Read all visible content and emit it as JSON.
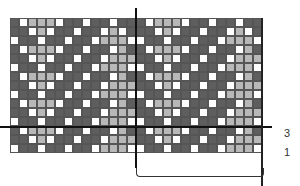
{
  "chart_title": "",
  "labels": {
    "row_3": "3",
    "row_1": "1"
  },
  "colors": {
    "dark": "#5e5e5e",
    "white": "#ffffff",
    "light": "#b8b8b8"
  },
  "grid": {
    "columns": 28,
    "rows": 15,
    "repeat_columns": 14,
    "repeat": [
      "DWLLLWDDWDDWDD",
      "DDWLWDDWDDWLWD",
      "WDDWDDWDDWLLLW",
      "DWLLLWDDWDDWLD",
      "DDWLWDDWDDWLLL",
      "WDDWDDWDDWLLLW",
      "DWLLLWDDWDDWLD",
      "DDWLWDDWDDWLLL",
      "WDDWDDWDDWLLLW",
      "DWLLLWDDWDDWLD",
      "DDWLWDDWDDWLLL",
      "WDDWDDWDDWLLLW",
      "DWLLLWDDWDDWLD",
      "DDWLWDDWDDWLLL",
      "WDDWDDWDDWLLLW"
    ]
  }
}
